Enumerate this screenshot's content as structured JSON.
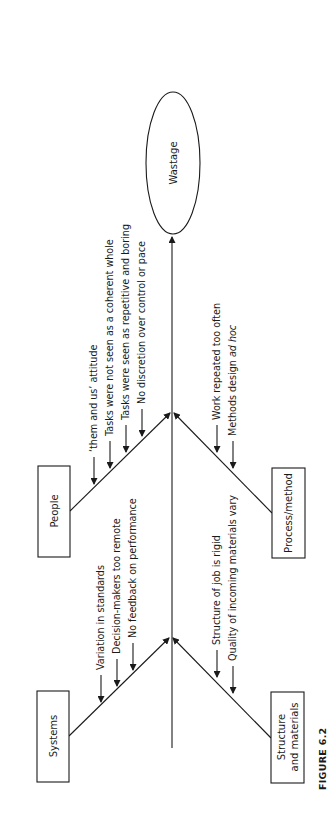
{
  "figure_label": "FIGURE 6.2",
  "effect": {
    "label": "Wastage"
  },
  "categories": {
    "people": {
      "label": "People",
      "causes": [
        "‘them and us’ attitude",
        "Tasks were not seen as a coherent whole",
        "Tasks were seen as repetitive and boring",
        "No discretion over control or pace"
      ]
    },
    "systems": {
      "label": "Systems",
      "causes": [
        "Variation in standards",
        "Decision-makers too remote",
        "No feedback on performance"
      ]
    },
    "process": {
      "label": "Process/method",
      "causes": [
        "Work repeated too often",
        "Methods design ",
        "ad hoc"
      ]
    },
    "structure": {
      "label_line1": "Structure",
      "label_line2": "and materials",
      "causes": [
        "Structure of job is rigid",
        "Quality of incoming materials vary"
      ]
    }
  },
  "colors": {
    "ink": "#1a1a1a",
    "background": "#ffffff"
  }
}
